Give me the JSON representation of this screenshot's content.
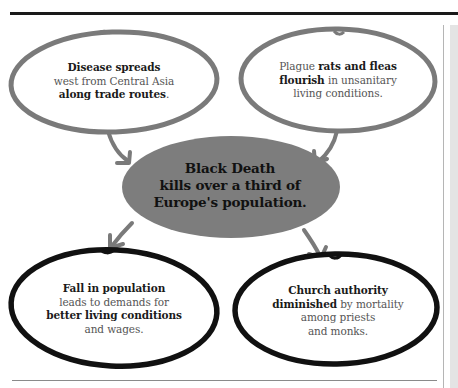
{
  "diagram": {
    "colors": {
      "top_node_outline": "#7a7a7a",
      "bottom_node_outline": "#111111",
      "center_fill": "#7d7d7d",
      "arrow": "#7a7a7a",
      "bold_text": "#1a1a1a",
      "regular_text": "#555555"
    },
    "center": {
      "line1": "Black Death",
      "line2": "kills over a third of",
      "line3": "Europe's population."
    },
    "nodes": [
      {
        "id": "disease-spreads",
        "position": "top-left",
        "line1_bold": "Disease spreads",
        "line2": "west from Central Asia",
        "line3_bold": "along trade routes",
        "line3_tail": "."
      },
      {
        "id": "rats-fleas",
        "position": "top-right",
        "line1_pre": "Plague ",
        "line1_bold": "rats and fleas",
        "line2_bold": "flourish",
        "line2_tail": " in unsanitary",
        "line3": "living conditions."
      },
      {
        "id": "fall-in-population",
        "position": "bottom-left",
        "line1_bold": "Fall in population",
        "line2": "leads to demands for",
        "line3_bold": "better living conditions",
        "line4": "and wages."
      },
      {
        "id": "church-authority",
        "position": "bottom-right",
        "line1_bold": "Church authority",
        "line2_bold": "diminished",
        "line2_tail": " by mortality",
        "line3": "among priests",
        "line4": "and monks."
      }
    ],
    "edges": [
      {
        "from": "disease-spreads",
        "to": "center"
      },
      {
        "from": "rats-fleas",
        "to": "center"
      },
      {
        "from": "center",
        "to": "fall-in-population"
      },
      {
        "from": "center",
        "to": "church-authority"
      }
    ]
  }
}
